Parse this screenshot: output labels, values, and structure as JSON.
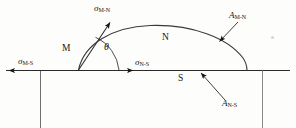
{
  "figure": {
    "type": "heterogeneous-nucleation-diagram",
    "width": 296,
    "height": 128,
    "background_color": "#fdfdfb",
    "ink_color": "#161616"
  },
  "regions": {
    "nucleus_label": "N",
    "matrix_label": "M",
    "substrate_label": "S"
  },
  "interfacial_energies": {
    "matrix_nucleus": {
      "symbol": "σ",
      "subscript": "M-N"
    },
    "matrix_substrate": {
      "symbol": "σ",
      "subscript": "M-S"
    },
    "nucleus_substrate": {
      "symbol": "σ",
      "subscript": "N-S"
    }
  },
  "areas": {
    "matrix_nucleus": {
      "symbol": "A",
      "subscript": "M-N"
    },
    "nucleus_substrate": {
      "symbol": "A",
      "subscript": "N-S"
    }
  },
  "angle": {
    "symbol": "θ",
    "name": "contact-angle"
  }
}
